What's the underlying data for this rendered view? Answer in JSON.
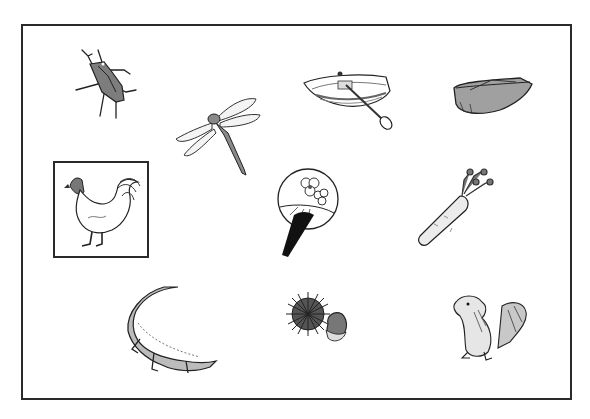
{
  "game": {
    "type": "picture-selection",
    "selected_item": "rooster",
    "items": [
      {
        "id": "beetle",
        "label": "beetle"
      },
      {
        "id": "dragonfly",
        "label": "dragonfly"
      },
      {
        "id": "rowboat",
        "label": "rowboat"
      },
      {
        "id": "sled",
        "label": "sled"
      },
      {
        "id": "rooster",
        "label": "rooster"
      },
      {
        "id": "uchiwa-fan",
        "label": "fan"
      },
      {
        "id": "carrot",
        "label": "carrot"
      },
      {
        "id": "crocodile",
        "label": "crocodile"
      },
      {
        "id": "chestnut",
        "label": "chestnut"
      },
      {
        "id": "chipmunk",
        "label": "chipmunk"
      }
    ]
  },
  "colors": {
    "frame_border": "#2a2a2a",
    "fill_gray": "#8a8a8a",
    "light_gray": "#c8c8c8",
    "background": "#ffffff"
  }
}
